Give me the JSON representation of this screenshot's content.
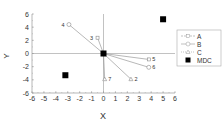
{
  "chart_data": {
    "type": "scatter",
    "title": "",
    "xlabel": "X",
    "ylabel": "Y",
    "xlim": [
      -6,
      6
    ],
    "ylim": [
      -6,
      6
    ],
    "xticks": [
      -6,
      -5,
      -4,
      -3,
      -2,
      -1,
      0,
      1,
      2,
      3,
      4,
      5,
      6
    ],
    "yticks": [
      -6,
      -4,
      -2,
      0,
      2,
      4,
      6
    ],
    "grid": false,
    "legend_position": "right",
    "origin": {
      "x": 0,
      "y": 0
    },
    "series": [
      {
        "name": "A",
        "marker": "small-square",
        "line": "solid",
        "points": [
          {
            "label": "3",
            "x": -0.5,
            "y": 2.4
          },
          {
            "label": "5",
            "x": 3.8,
            "y": -0.9
          }
        ]
      },
      {
        "name": "B",
        "marker": "circle",
        "line": "solid",
        "points": [
          {
            "label": "4",
            "x": -2.9,
            "y": 4.4
          },
          {
            "label": "6",
            "x": 3.8,
            "y": -2.1
          }
        ]
      },
      {
        "name": "C",
        "marker": "triangle",
        "line": "solid",
        "points": [
          {
            "label": "2",
            "x": 2.3,
            "y": -3.9
          },
          {
            "label": "7",
            "x": 0.1,
            "y": -3.9
          }
        ]
      },
      {
        "name": "MDC",
        "marker": "filled-square",
        "line": "none",
        "points": [
          {
            "x": 0,
            "y": 0
          },
          {
            "x": -3.2,
            "y": -3.3
          },
          {
            "x": 5.0,
            "y": 5.2
          }
        ]
      }
    ]
  },
  "legend": {
    "items": [
      {
        "label": "A"
      },
      {
        "label": "B"
      },
      {
        "label": "C"
      },
      {
        "label": "MDC"
      }
    ]
  },
  "axes": {
    "xlabel": "X",
    "ylabel": "Y"
  }
}
